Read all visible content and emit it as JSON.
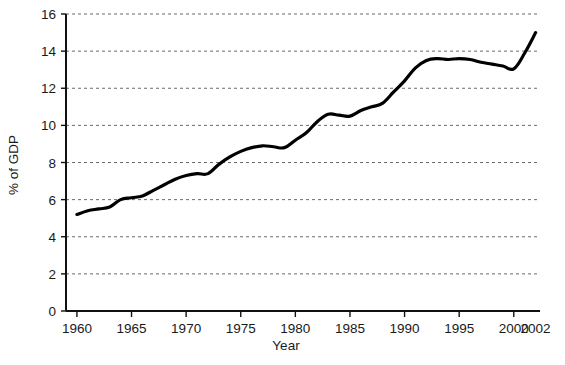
{
  "chart_data": {
    "type": "line",
    "title": "",
    "subtitle": "",
    "xlabel": "Year",
    "ylabel": "% of GDP",
    "xlim": [
      1959,
      2002.4
    ],
    "ylim": [
      0,
      16
    ],
    "grid": "horizontal-dotted",
    "legend": "none",
    "x_ticks": [
      1960,
      1965,
      1970,
      1975,
      1980,
      1985,
      1990,
      1995,
      2000,
      2002
    ],
    "x_tick_labels": [
      "1960",
      "1965",
      "1970",
      "1975",
      "1980",
      "1985",
      "1990",
      "1995",
      "2000",
      "2002"
    ],
    "y_ticks": [
      0,
      2,
      4,
      6,
      8,
      10,
      12,
      14,
      16
    ],
    "y_tick_labels": [
      "0",
      "2",
      "4",
      "6",
      "8",
      "10",
      "12",
      "14",
      "16"
    ],
    "series": [
      {
        "name": "",
        "color": "#000000",
        "line_width": 3.2,
        "x": [
          1960,
          1961,
          1962,
          1963,
          1964,
          1965,
          1966,
          1967,
          1968,
          1969,
          1970,
          1971,
          1972,
          1973,
          1974,
          1975,
          1976,
          1977,
          1978,
          1979,
          1980,
          1981,
          1982,
          1983,
          1984,
          1985,
          1986,
          1987,
          1988,
          1989,
          1990,
          1991,
          1992,
          1993,
          1994,
          1995,
          1996,
          1997,
          1998,
          1999,
          2000,
          2001,
          2002
        ],
        "values": [
          5.2,
          5.4,
          5.5,
          5.6,
          6.0,
          6.1,
          6.2,
          6.5,
          6.8,
          7.1,
          7.3,
          7.4,
          7.4,
          7.9,
          8.3,
          8.6,
          8.8,
          8.9,
          8.85,
          8.8,
          9.2,
          9.6,
          10.2,
          10.6,
          10.55,
          10.5,
          10.8,
          11.0,
          11.2,
          11.8,
          12.4,
          13.1,
          13.5,
          13.6,
          13.55,
          13.6,
          13.55,
          13.4,
          13.3,
          13.2,
          13.05,
          13.9,
          15.0
        ]
      }
    ]
  },
  "axis": {
    "y_label": "% of GDP",
    "x_label": "Year"
  }
}
